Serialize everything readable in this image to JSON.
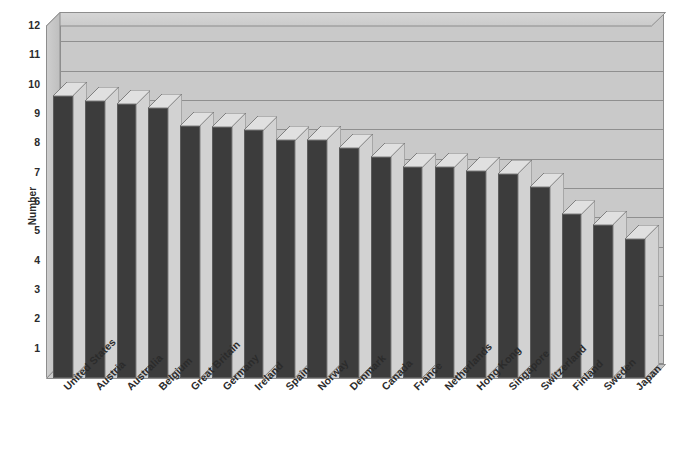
{
  "chart_data": {
    "type": "bar",
    "title": "",
    "xlabel": "",
    "ylabel": "Number",
    "ylim": [
      0,
      12
    ],
    "yticks": [
      1,
      2,
      3,
      4,
      5,
      6,
      7,
      8,
      9,
      10,
      11,
      12
    ],
    "grid": true,
    "legend": null,
    "style": "3d-column",
    "bar_color": "#3c3c3c",
    "plot_background": "#c9c9c9",
    "categories": [
      "United States",
      "Austria",
      "Australia",
      "Belgium",
      "Great Britain",
      "Germany",
      "Ireland",
      "Spain",
      "Norway",
      "Denmark",
      "Canada",
      "France",
      "Netherlands",
      "Hong Kong",
      "Singapore",
      "Switzerland",
      "Finland",
      "Sweden",
      "Japan"
    ],
    "values": [
      9.6,
      9.45,
      9.35,
      9.2,
      8.6,
      8.55,
      8.45,
      8.1,
      8.1,
      7.85,
      7.55,
      7.2,
      7.2,
      7.05,
      6.95,
      6.5,
      5.6,
      5.2,
      4.75
    ]
  },
  "axis": {
    "y_title": "Number"
  }
}
